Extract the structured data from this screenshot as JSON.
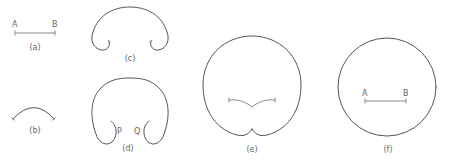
{
  "figure": {
    "panels": [
      {
        "id": "a",
        "caption": "(a)",
        "labels": [
          "A",
          "B"
        ],
        "description": "straight line segment AB"
      },
      {
        "id": "b",
        "caption": "(b)",
        "labels": [],
        "description": "segment bent into an arc"
      },
      {
        "id": "c",
        "caption": "(c)",
        "labels": [],
        "description": "arc bent further with curled ends"
      },
      {
        "id": "d",
        "caption": "(d)",
        "labels": [
          "P",
          "Q"
        ],
        "description": "nearly closed loop with curled ends P and Q"
      },
      {
        "id": "e",
        "caption": "(e)",
        "labels": [],
        "description": "closed loop with inward cusp at bottom"
      },
      {
        "id": "f",
        "caption": "(f)",
        "labels": [
          "A",
          "B"
        ],
        "description": "circle with segment AB inside"
      }
    ]
  },
  "colors": {
    "stroke": "#555555",
    "segment": "#888888",
    "text": "#666666",
    "background": "#ffffff"
  }
}
